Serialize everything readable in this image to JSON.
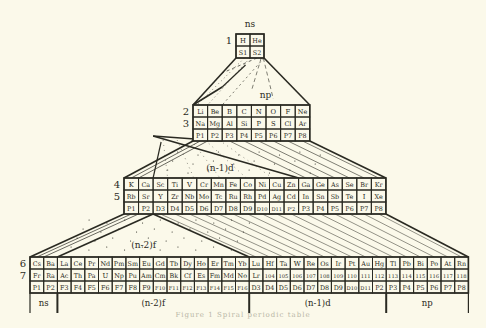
{
  "diagram": {
    "background": "#fbf9ea",
    "ink": "#2a2a22",
    "labels": {
      "ns_top": "ns",
      "np_mid": "np",
      "n1d_mid": "(n-1)d",
      "n2f_mid": "(n-2)f"
    },
    "blocks": [
      {
        "id": "period-1",
        "x": 236,
        "y": 34,
        "cell_w": 14,
        "cell_h": 12,
        "period_labels": [
          "1"
        ],
        "rows": [
          [
            "H",
            "He"
          ],
          [
            "S1",
            "S2"
          ]
        ]
      },
      {
        "id": "period-2-3",
        "x": 193,
        "y": 105,
        "cell_w": 14.6,
        "cell_h": 12,
        "period_labels": [
          "2",
          "3"
        ],
        "rows": [
          [
            "Li",
            "Be",
            "B",
            "C",
            "N",
            "O",
            "F",
            "Ne"
          ],
          [
            "Na",
            "Mg",
            "Al",
            "Si",
            "P",
            "S",
            "Cl",
            "Ar"
          ],
          [
            "P1",
            "P2",
            "P3",
            "P4",
            "P5",
            "P6",
            "P7",
            "P8"
          ]
        ]
      },
      {
        "id": "period-4-5",
        "x": 124,
        "y": 178,
        "cell_w": 14.55,
        "cell_h": 12,
        "period_labels": [
          "4",
          "5"
        ],
        "rows": [
          [
            "K",
            "Ca",
            "Sc",
            "Ti",
            "V",
            "Cr",
            "Mn",
            "Fe",
            "Co",
            "Ni",
            "Cu",
            "Zn",
            "Ga",
            "Ge",
            "As",
            "Se",
            "Br",
            "Kr"
          ],
          [
            "Rb",
            "Sr",
            "Y",
            "Zr",
            "Nb",
            "Mo",
            "Tc",
            "Ru",
            "Rh",
            "Pd",
            "Ag",
            "Cd",
            "In",
            "Sn",
            "Sb",
            "Te",
            "I",
            "Xe"
          ],
          [
            "P1",
            "P2",
            "D3",
            "D4",
            "D5",
            "D6",
            "D7",
            "D8",
            "D9",
            "D10",
            "D11",
            "P'2",
            "P3",
            "P4",
            "P5",
            "P6",
            "P7",
            "P8"
          ]
        ]
      },
      {
        "id": "period-6-7",
        "x": 30,
        "y": 257,
        "cell_w": 13.7,
        "cell_h": 12,
        "period_labels": [
          "6",
          "7"
        ],
        "rows": [
          [
            "Cs",
            "Ba",
            "La",
            "Ce",
            "Pr",
            "Nd",
            "Pm",
            "Sm",
            "Eu",
            "Gd",
            "Tb",
            "Dy",
            "Ho",
            "Er",
            "Tm",
            "Yb",
            "Lu",
            "Hf",
            "Ta",
            "W",
            "Re",
            "Os",
            "Ir",
            "Pt",
            "Au",
            "Hg",
            "Tl",
            "Pb",
            "Bi",
            "Po",
            "At",
            "Rn"
          ],
          [
            "Fr",
            "Ra",
            "Ac",
            "Th",
            "Pa",
            "U",
            "Np",
            "Pu",
            "Am",
            "Cm",
            "Bk",
            "Cf",
            "Es",
            "Fm",
            "Md",
            "No",
            "Lr",
            "104",
            "105",
            "106",
            "107",
            "108",
            "109",
            "110",
            "111",
            "112",
            "113",
            "114",
            "115",
            "116",
            "117",
            "118"
          ],
          [
            "P1",
            "P2",
            "F3",
            "F4",
            "F5",
            "F6",
            "F7",
            "F8",
            "F9",
            "F10",
            "F11",
            "F12",
            "F13",
            "F14",
            "F15",
            "F16",
            "D3",
            "D4",
            "D5",
            "D6",
            "D7",
            "D8",
            "D9",
            "D10",
            "D11",
            "P2",
            "P3",
            "P4",
            "P5",
            "P6",
            "P7",
            "P8"
          ]
        ]
      }
    ],
    "bottom_groups": [
      {
        "label": "ns",
        "cols": 2
      },
      {
        "label": "(n-2)f",
        "cols": 14
      },
      {
        "label": "(n-1)d",
        "cols": 10
      },
      {
        "label": "np",
        "cols": 6
      }
    ],
    "caption": "Figure 1 Spiral periodic table"
  }
}
